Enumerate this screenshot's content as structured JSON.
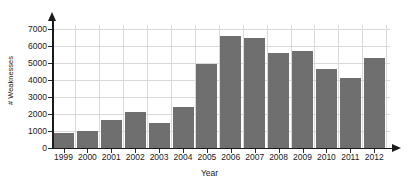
{
  "chart_data": {
    "type": "bar",
    "title": "",
    "xlabel": "Year",
    "ylabel": "# Weaknesses",
    "categories": [
      "1999",
      "2000",
      "2001",
      "2002",
      "2003",
      "2004",
      "2005",
      "2006",
      "2007",
      "2008",
      "2009",
      "2010",
      "2011",
      "2012"
    ],
    "values": [
      900,
      1020,
      1630,
      2140,
      1500,
      2420,
      4930,
      6600,
      6500,
      5600,
      5730,
      4620,
      4100,
      5280
    ],
    "series": [
      {
        "name": "# Weaknesses",
        "values": [
          900,
          1020,
          1630,
          2140,
          1500,
          2420,
          4930,
          6600,
          6500,
          5600,
          5730,
          4620,
          4100,
          5280
        ]
      }
    ],
    "ylim": [
      0,
      7000
    ],
    "yticks": [
      0,
      1000,
      2000,
      3000,
      4000,
      5000,
      6000,
      7000
    ],
    "ytick_labels": [
      "0",
      "1000",
      "2000",
      "3000",
      "4000",
      "5000",
      "6000",
      "7000"
    ],
    "grid": true,
    "legend": "none",
    "bar_color": "#6f6f6f",
    "grid_color": "#d9d9d9",
    "axis_color": "#1a1a1a",
    "background_color": "#ffffff"
  }
}
